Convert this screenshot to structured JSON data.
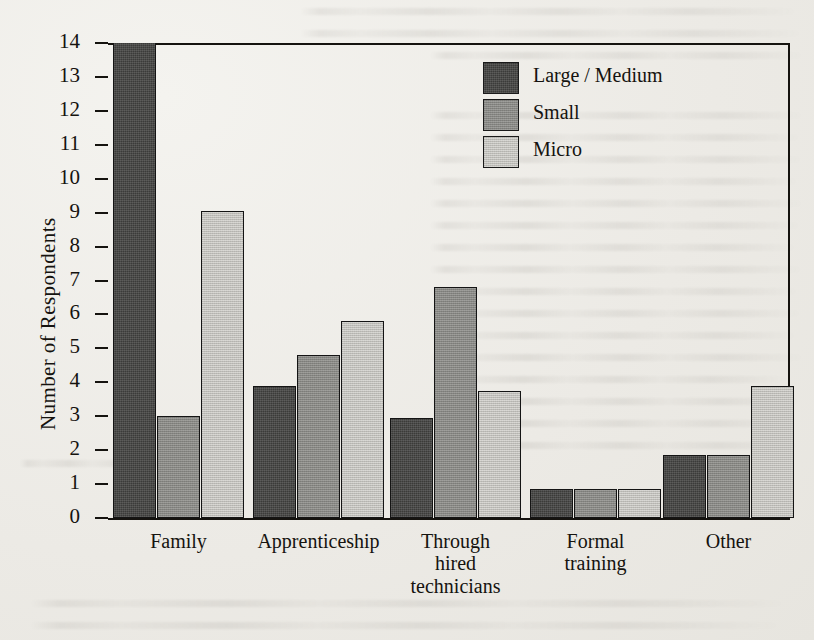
{
  "chart_data": {
    "type": "bar",
    "title": "",
    "xlabel": "",
    "ylabel": "Number of Respondents",
    "ylim": [
      0,
      14
    ],
    "ytick_step": 1,
    "yticks": [
      "14",
      "13",
      "12",
      "11",
      "10",
      "9",
      "8",
      "7",
      "6",
      "5",
      "4",
      "3",
      "2",
      "1",
      "0"
    ],
    "grid": false,
    "legend_position": "top-right",
    "categories": [
      "Family",
      "Apprenticeship",
      "Through\nhired\ntechnicians",
      "Formal\ntraining",
      "Other"
    ],
    "series": [
      {
        "name": "Large / Medium",
        "color": "#3b3b39",
        "values": [
          14,
          3.9,
          2.95,
          0.85,
          1.85
        ]
      },
      {
        "name": "Small",
        "color": "#8d8d89",
        "values": [
          3,
          4.8,
          6.8,
          0.85,
          1.85
        ]
      },
      {
        "name": "Micro",
        "color": "#c8c7c2",
        "values": [
          9.05,
          5.8,
          3.75,
          0.85,
          3.9
        ]
      }
    ]
  },
  "axis": {
    "y_title": "Number of Respondents"
  },
  "legend": {
    "items": [
      {
        "label": "Large / Medium",
        "swatch": "legend-swatch-large-medium"
      },
      {
        "label": "Small",
        "swatch": "legend-swatch-small"
      },
      {
        "label": "Micro",
        "swatch": "legend-swatch-micro"
      }
    ]
  }
}
